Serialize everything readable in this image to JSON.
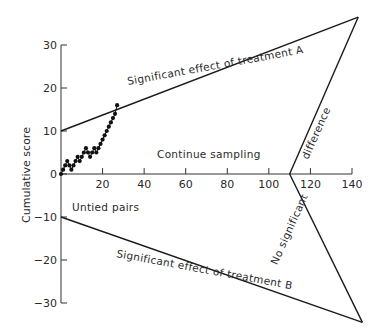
{
  "chart_data": {
    "type": "line",
    "title": "",
    "xlabel": "",
    "ylabel": "Cumulative score",
    "xlim": [
      0,
      140
    ],
    "ylim": [
      -30,
      30
    ],
    "grid": false,
    "x_ticks": [
      20,
      40,
      60,
      80,
      100,
      120,
      140
    ],
    "x_tick_labels": [
      "20",
      "40",
      "60",
      "80",
      "100",
      "120",
      "140"
    ],
    "y_ticks": [
      30,
      20,
      10,
      0,
      -10,
      -20,
      -30
    ],
    "y_tick_labels": [
      "30",
      "20",
      "10",
      "0",
      "−10",
      "−20",
      "−30"
    ],
    "annotations": {
      "upper_boundary": "Significant effect of treatment A",
      "lower_boundary": "Significant effect of treatment B",
      "continue_region": "Continue sampling",
      "x_axis_note": "Untied pairs",
      "right_upper": "difference",
      "right_lower": "No significant"
    },
    "boundaries": {
      "upper": {
        "x": [
          0,
          143
        ],
        "y": [
          10,
          36.5
        ]
      },
      "lower": {
        "x": [
          0,
          145
        ],
        "y": [
          -10,
          -34.5
        ]
      },
      "right_upper": {
        "x": [
          110,
          143
        ],
        "y": [
          0,
          36.5
        ]
      },
      "right_lower": {
        "x": [
          110,
          145
        ],
        "y": [
          0,
          -34.5
        ]
      }
    },
    "series": [
      {
        "name": "Cumulative score (sequential trial path)",
        "x": [
          0,
          1,
          2,
          3,
          4,
          5,
          6,
          7,
          8,
          9,
          10,
          11,
          12,
          13,
          14,
          15,
          16,
          17,
          18,
          19,
          20,
          21,
          22,
          23,
          24,
          25,
          26,
          27
        ],
        "y": [
          0,
          1,
          2,
          3,
          2,
          1,
          2,
          3,
          4,
          3,
          4,
          5,
          6,
          5,
          4,
          5,
          6,
          5,
          6,
          7,
          8,
          9,
          10,
          11,
          12,
          13,
          14,
          16
        ]
      }
    ]
  }
}
